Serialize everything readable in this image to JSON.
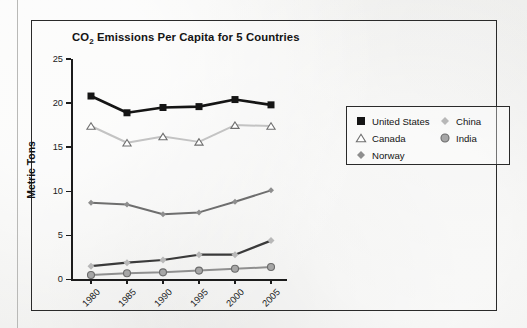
{
  "chart_data": {
    "type": "line",
    "title": "CO2 Emissions Per Capita for 5 Countries",
    "title_main": "CO",
    "title_sub": "2",
    "title_rest": " Emissions Per Capita for 5 Countries",
    "xlabel": "",
    "ylabel": "Metric Tons",
    "categories": [
      "1980",
      "1985",
      "1990",
      "1995",
      "2000",
      "2005"
    ],
    "x": [
      1980,
      1985,
      1990,
      1995,
      2000,
      2005
    ],
    "ylim": [
      0,
      25
    ],
    "yticks": [
      "0",
      "5",
      "10",
      "15",
      "20",
      "25"
    ],
    "ytick_values": [
      0,
      5,
      10,
      15,
      20,
      25
    ],
    "grid": false,
    "legend_position": "right",
    "series": [
      {
        "name": "United States",
        "values": [
          20.8,
          18.9,
          19.5,
          19.6,
          20.4,
          19.8
        ],
        "marker": "square",
        "color": "#151515",
        "marker_fill": "#151515",
        "line_width": 2.6,
        "marker_size": 7
      },
      {
        "name": "Canada",
        "values": [
          17.4,
          15.5,
          16.2,
          15.6,
          17.5,
          17.4
        ],
        "marker": "triangle",
        "color": "#c3c3c3",
        "marker_fill": "#ffffff",
        "marker_stroke": "#6f6f6f",
        "line_width": 2.0,
        "marker_size": 7
      },
      {
        "name": "Norway",
        "values": [
          8.7,
          8.5,
          7.4,
          7.6,
          8.8,
          10.1
        ],
        "marker": "diamond",
        "color": "#6e6e6e",
        "marker_fill": "#8e8e8e",
        "line_width": 2.0,
        "marker_size": 6
      },
      {
        "name": "China",
        "values": [
          1.5,
          1.9,
          2.2,
          2.8,
          2.8,
          4.4
        ],
        "marker": "diamond",
        "color": "#3a3a3a",
        "marker_fill": "#b8b8b8",
        "line_width": 2.2,
        "marker_size": 7
      },
      {
        "name": "India",
        "values": [
          0.5,
          0.7,
          0.8,
          1.0,
          1.2,
          1.4
        ],
        "marker": "circle",
        "color": "#8f8f8f",
        "marker_fill": "#a6a6a6",
        "marker_stroke": "#6b6b6b",
        "line_width": 2.0,
        "marker_size": 7
      }
    ]
  },
  "legend": {
    "left_column": [
      "United States",
      "Canada",
      "Norway"
    ],
    "right_column": [
      "China",
      "India"
    ]
  },
  "colors": {
    "frame": "#2a2a2a",
    "axis": "#1c1c1c",
    "text": "#131313",
    "background": "#f2f2f0"
  }
}
